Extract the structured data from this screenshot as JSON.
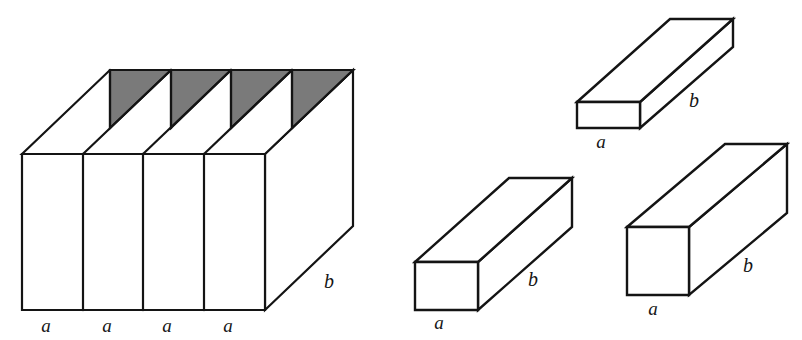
{
  "figure": {
    "background_color": "#ffffff",
    "stroke_color": "#141414",
    "shade_color": "#7a7a7a",
    "face_color": "#ffffff",
    "labels": {
      "a": "a",
      "b": "b"
    },
    "shapes": [
      {
        "name": "large-segmented-prism",
        "description": "Large rectangular prism divided into four equal vertical slabs, each of width a and depth b, with shaded triangular wedges on the top face",
        "segments": 4,
        "segment_width_label": "a",
        "depth_label": "b",
        "shaded_top_wedges": 4,
        "edge_labels": [
          "a",
          "a",
          "a",
          "a",
          "b"
        ]
      },
      {
        "name": "flat-slab-prism",
        "description": "Thin flat rectangular prism lying lengthwise",
        "width_label": "a",
        "depth_label": "b",
        "edge_labels": [
          "a",
          "b"
        ]
      },
      {
        "name": "square-bar-prism-left",
        "description": "Long square-cross-section bar",
        "width_label": "a",
        "depth_label": "b",
        "edge_labels": [
          "a",
          "b"
        ]
      },
      {
        "name": "square-bar-prism-right",
        "description": "Long square-cross-section bar, taller front face",
        "width_label": "a",
        "depth_label": "b",
        "edge_labels": [
          "a",
          "b"
        ]
      }
    ],
    "label_positions": [
      {
        "id": "large-seg-1-a",
        "text": "a",
        "x": 46,
        "y": 332
      },
      {
        "id": "large-seg-2-a",
        "text": "a",
        "x": 107,
        "y": 332
      },
      {
        "id": "large-seg-3-a",
        "text": "a",
        "x": 167,
        "y": 332
      },
      {
        "id": "large-seg-4-a",
        "text": "a",
        "x": 228,
        "y": 332
      },
      {
        "id": "large-b",
        "text": "b",
        "x": 329,
        "y": 288
      },
      {
        "id": "flat-a",
        "text": "a",
        "x": 601,
        "y": 148
      },
      {
        "id": "flat-b",
        "text": "b",
        "x": 694,
        "y": 107
      },
      {
        "id": "bar-left-a",
        "text": "a",
        "x": 439,
        "y": 329
      },
      {
        "id": "bar-left-b",
        "text": "b",
        "x": 533,
        "y": 286
      },
      {
        "id": "bar-right-a",
        "text": "a",
        "x": 653,
        "y": 315
      },
      {
        "id": "bar-right-b",
        "text": "b",
        "x": 748,
        "y": 272
      }
    ]
  }
}
